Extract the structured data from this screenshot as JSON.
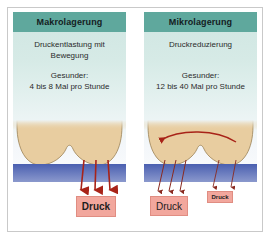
{
  "figure": {
    "background_color": "#ffffff",
    "frame_color": "#c9c9c9"
  },
  "colors": {
    "header_teal": "#5fa89d",
    "panel_top": "#cfe6e2",
    "panel_bottom": "#fbfcfe",
    "body_tan": "#e8cda0",
    "body_outline": "#9a8256",
    "mattress_blue_top": "#4a5fb0",
    "mattress_blue_bottom": "#8090c8",
    "arrow_red": "#a82318",
    "arrow_thin": "#8a2a20",
    "label_fill": "#f2a79d",
    "label_border": "#e08d82"
  },
  "panels": [
    {
      "id": "makrolagerung",
      "header": "Makrolagerung",
      "description": "Druckentlastung mit Bewegung",
      "subject_label": "Gesunder:",
      "frequency": "4 bis 8 Mal pro Stunde",
      "illustration": {
        "name": "buttocks-on-mattress",
        "has_curved_motion_arrow": false,
        "pressure_arrow_count": 3,
        "pressure_arrow_weight": "thick"
      }
    },
    {
      "id": "mikrolagerung",
      "header": "Mikrolagerung",
      "description": "Druckreduzierung",
      "subject_label": "Gesunder:",
      "frequency": "12 bis 40 Mal pro Stunde",
      "illustration": {
        "name": "buttocks-on-mattress",
        "has_curved_motion_arrow": true,
        "pressure_arrow_count": 5,
        "pressure_arrow_weight": "thin"
      }
    }
  ],
  "pressure_labels": [
    {
      "id": "druck-left",
      "text": "Druck",
      "emphasis": "bold",
      "size": "large"
    },
    {
      "id": "druck-mid",
      "text": "Druck",
      "emphasis": "normal",
      "size": "medium"
    },
    {
      "id": "druck-small",
      "text": "Druck",
      "emphasis": "bold",
      "size": "small"
    }
  ]
}
